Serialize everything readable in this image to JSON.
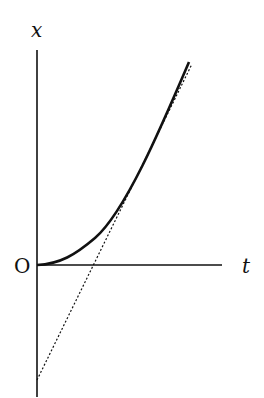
{
  "diagram": {
    "type": "position-time graph",
    "labels": {
      "y_axis": "x",
      "x_axis": "t",
      "origin": "O"
    },
    "curves": [
      {
        "name": "position curve",
        "style": "solid",
        "description": "starts at origin with zero slope, curves upward becoming nearly linear"
      },
      {
        "name": "asymptote",
        "style": "dashed",
        "description": "straight line intersecting negative x-axis and crossing t-axis, parallel to curve at large t"
      }
    ],
    "colors": {
      "ink": "#111111",
      "background": "#ffffff"
    }
  }
}
